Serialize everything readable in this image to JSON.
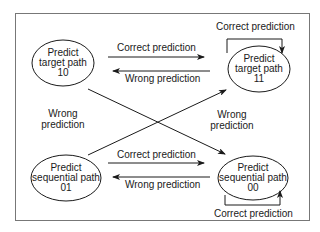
{
  "diagram": {
    "type": "state-machine",
    "title": "",
    "nodes": [
      {
        "id": "10",
        "lines": [
          "Predict",
          "target path",
          "10"
        ]
      },
      {
        "id": "11",
        "lines": [
          "Predict",
          "target path",
          "11"
        ]
      },
      {
        "id": "01",
        "lines": [
          "Predict",
          "sequential path",
          "01"
        ]
      },
      {
        "id": "00",
        "lines": [
          "Predict",
          "sequential path",
          "00"
        ]
      }
    ],
    "edges": [
      {
        "from": "10",
        "to": "11",
        "label": "Correct prediction"
      },
      {
        "from": "11",
        "to": "10",
        "label": "Wrong prediction"
      },
      {
        "from": "11",
        "to": "11",
        "label": "Correct prediction"
      },
      {
        "from": "10",
        "to": "00",
        "label_lines": [
          "Wrong",
          "prediction"
        ]
      },
      {
        "from": "01",
        "to": "11",
        "label_lines": [
          "Wrong",
          "prediction"
        ]
      },
      {
        "from": "01",
        "to": "00",
        "label": "Correct prediction"
      },
      {
        "from": "00",
        "to": "01",
        "label": "Wrong prediction"
      },
      {
        "from": "00",
        "to": "00",
        "label": "Correct prediction"
      }
    ]
  },
  "colors": {
    "line": "#1a1a1a",
    "frame": "#777777",
    "background": "#ffffff"
  }
}
